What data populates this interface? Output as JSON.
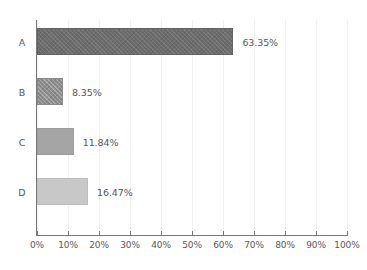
{
  "chart_data": {
    "type": "bar",
    "orientation": "horizontal",
    "title": "",
    "subtitle": "",
    "xlabel": "",
    "ylabel": "",
    "categories": [
      "A",
      "B",
      "C",
      "D"
    ],
    "values": [
      63.35,
      8.35,
      11.84,
      16.47
    ],
    "value_labels": [
      "63.35%",
      "8.35%",
      "11.84%",
      "16.47%"
    ],
    "xlim": [
      0,
      100
    ],
    "xticks": [
      0,
      10,
      20,
      30,
      40,
      50,
      60,
      70,
      80,
      90,
      100
    ],
    "xtick_labels": [
      "0%",
      "10%",
      "20%",
      "30%",
      "40%",
      "50%",
      "60%",
      "70%",
      "80%",
      "90%",
      "100%"
    ],
    "grid": true,
    "grid_axis": "x",
    "legend": false,
    "legend_position": "none",
    "series": [
      {
        "name": "",
        "points": [
          {
            "category": "A",
            "value": 63.35,
            "label": "63.35%",
            "fill": "#6d6d6d",
            "pattern": "hatch"
          },
          {
            "category": "B",
            "value": 8.35,
            "label": "8.35%",
            "fill": "#8d8d8d",
            "pattern": "crosshatch"
          },
          {
            "category": "C",
            "value": 11.84,
            "label": "11.84%",
            "fill": "#a5a5a5",
            "pattern": "solid"
          },
          {
            "category": "D",
            "value": 16.47,
            "label": "16.47%",
            "fill": "#c8c8c8",
            "pattern": "solid"
          }
        ]
      }
    ],
    "colors": {
      "background": "#ffffff",
      "axis": "#777777",
      "grid": "#f0f0f0",
      "text": "#58585a"
    }
  }
}
